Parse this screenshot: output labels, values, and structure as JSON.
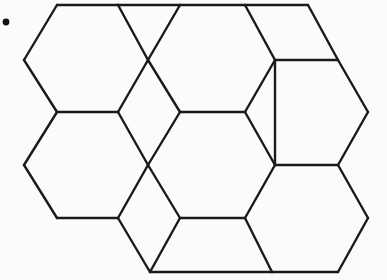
{
  "figure": {
    "canvas": {
      "width": 387,
      "height": 280
    },
    "colors": {
      "background": "#fbfbfa",
      "stroke": "#1a1a1a",
      "face": "#fbfbfa",
      "dot": "#111111"
    },
    "stroke_width": 2.4,
    "lattice": {
      "x_pitch": 60,
      "y_pitch": 52.5,
      "origin_x": 24,
      "origin_y": 60
    },
    "marks": [
      {
        "name": "corner-dot",
        "shape": "dot",
        "cx": 6,
        "cy": 22,
        "r": 3.4
      }
    ],
    "tiles": [
      {
        "name": "hexagon-row1-left",
        "shape": "hexagon",
        "points": "57,5 118,5 148,60 118,112 57,112 24,60"
      },
      {
        "name": "rhombus-row1-upper-left",
        "shape": "rhombus",
        "points": "118,5 180,5 148,60"
      },
      {
        "name": "hexagon-row1-center",
        "shape": "hexagon",
        "points": "180,5 245,5 275,60 245,112 180,112 148,60"
      },
      {
        "name": "rhombus-row1-upper-right",
        "shape": "rhombus",
        "points": "245,5 308,5 338,60 275,60"
      },
      {
        "name": "hexagon-row1-right",
        "shape": "hexagon",
        "points": "308,5 338,60 368,112 338,165 275,165 275,60"
      },
      {
        "name": "hexagon-row2-left",
        "shape": "hexagon",
        "points": "57,112 118,112 148,165 118,218 57,218 24,165"
      },
      {
        "name": "hexagon-row2-center",
        "shape": "hexagon",
        "points": "180,112 245,112 275,165 245,218 180,218 148,165"
      },
      {
        "name": "hexagon-row3-center",
        "shape": "hexagon",
        "points": "180,218 245,272 338,272 368,218 338,165 275,165"
      },
      {
        "name": "rhombus-row2-lower-left",
        "shape": "rhombus",
        "points": "118,218 150,272 180,218"
      }
    ],
    "edges": [
      {
        "name": "edge-top-1",
        "d": "M 57,5 L 118,5"
      },
      {
        "name": "edge-top-2",
        "d": "M 118,5 L 180,5"
      },
      {
        "name": "edge-top-3",
        "d": "M 180,5 L 245,5"
      },
      {
        "name": "edge-top-4",
        "d": "M 245,5 L 308,5"
      },
      {
        "name": "edge-left-upper-a",
        "d": "M 57,5 L 24,60"
      },
      {
        "name": "edge-left-upper-b",
        "d": "M 24,60 L 57,112"
      },
      {
        "name": "edge-left-lower-a",
        "d": "M 57,112 L 24,165"
      },
      {
        "name": "edge-left-lower-b",
        "d": "M 24,165 L 57,218"
      },
      {
        "name": "edge-hex1-right-upper",
        "d": "M 118,5 L 148,60"
      },
      {
        "name": "edge-hex1-right-lower",
        "d": "M 148,60 L 118,112"
      },
      {
        "name": "edge-rhomb1-right",
        "d": "M 180,5 L 148,60"
      },
      {
        "name": "edge-hexcenter-left-lower",
        "d": "M 148,60 L 180,112"
      },
      {
        "name": "edge-hexcenter-right-upper",
        "d": "M 245,5 L 275,60"
      },
      {
        "name": "edge-hexcenter-right-lower",
        "d": "M 275,60 L 245,112"
      },
      {
        "name": "edge-rhomb2-top-right",
        "d": "M 308,5 L 338,60"
      },
      {
        "name": "edge-rhomb2-bottom",
        "d": "M 275,60 L 338,60"
      },
      {
        "name": "edge-hexright-right-upper",
        "d": "M 338,60 L 368,112"
      },
      {
        "name": "edge-hexright-right-lower",
        "d": "M 368,112 L 338,165"
      },
      {
        "name": "edge-hexright-left",
        "d": "M 275,60 L 275,165"
      },
      {
        "name": "edge-mid-row1-left",
        "d": "M 57,112 L 118,112"
      },
      {
        "name": "edge-mid-row1-center",
        "d": "M 180,112 L 245,112"
      },
      {
        "name": "edge-hex2left-right-upper",
        "d": "M 118,112 L 148,165"
      },
      {
        "name": "edge-hex2left-right-lower",
        "d": "M 148,165 L 118,218"
      },
      {
        "name": "edge-hex2center-left-upper",
        "d": "M 180,112 L 148,165"
      },
      {
        "name": "edge-hex2center-left-lower",
        "d": "M 148,165 L 180,218"
      },
      {
        "name": "edge-hex2center-right-upper",
        "d": "M 245,112 L 275,165"
      },
      {
        "name": "edge-hex2center-right-lower",
        "d": "M 275,165 L 245,218"
      },
      {
        "name": "edge-mid-row2-left",
        "d": "M 57,218 L 118,218"
      },
      {
        "name": "edge-mid-row2-center",
        "d": "M 180,218 L 245,218"
      },
      {
        "name": "edge-mid-row2-right",
        "d": "M 275,165 L 338,165"
      },
      {
        "name": "edge-hex3-left",
        "d": "M 118,218 L 150,272"
      },
      {
        "name": "edge-hex3-left-inner",
        "d": "M 180,218 L 150,272"
      },
      {
        "name": "edge-bottom-1",
        "d": "M 150,272 L 272,272"
      },
      {
        "name": "edge-bottom-2",
        "d": "M 272,272 L 338,272"
      },
      {
        "name": "edge-hex3-right-lower",
        "d": "M 338,272 L 368,218"
      },
      {
        "name": "edge-hex3-right-upper",
        "d": "M 368,218 L 338,165"
      },
      {
        "name": "edge-hex3-diag-right",
        "d": "M 245,218 L 272,272"
      }
    ]
  }
}
